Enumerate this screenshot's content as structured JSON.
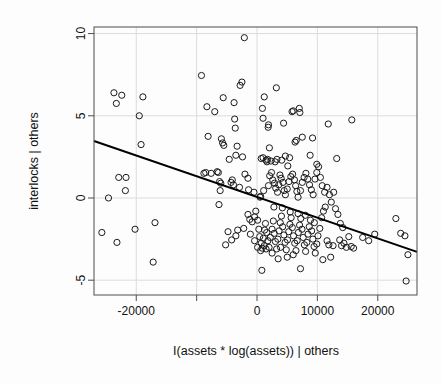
{
  "chart_data": {
    "type": "scatter",
    "title": "",
    "subtitle": "",
    "xlabel": "I(assets * log(assets)) | others",
    "ylabel": "interlocks | others",
    "xlim": [
      -27000,
      26500
    ],
    "ylim": [
      -5.9,
      10.4
    ],
    "grid": true,
    "legend": false,
    "legend_position": "none",
    "xticks": [
      -20000,
      -10000,
      0,
      10000,
      20000
    ],
    "xtick_labels": [
      "-20000",
      "",
      "0",
      "10000",
      "20000"
    ],
    "yticks": [
      -5,
      0,
      5,
      10
    ],
    "ytick_labels": [
      "-5",
      "0",
      "5",
      "10"
    ],
    "point_style": {
      "marker": "open-circle",
      "radius": 3.1,
      "stroke": "#1a1a1a",
      "stroke_width": 1.0,
      "fill": "none"
    },
    "fit_line": {
      "label": "least-squares partial fit",
      "color": "#000000",
      "width": 2.0,
      "x_start": -27000,
      "y_start": 3.47,
      "x_end": 26500,
      "y_end": -3.28,
      "slope": -0.000126,
      "intercept": 0.067
    },
    "frame": {
      "color": "#4d4d4d",
      "width": 1.0
    },
    "grid_color": "#dcdcdc",
    "points": [
      [
        -2100,
        9.75
      ],
      [
        -9200,
        7.45
      ],
      [
        -23700,
        6.4
      ],
      [
        -22400,
        6.25
      ],
      [
        -18900,
        6.15
      ],
      [
        -5600,
        6.1
      ],
      [
        -23300,
        5.75
      ],
      [
        -3800,
        5.8
      ],
      [
        -2800,
        6.85
      ],
      [
        -2500,
        7.05
      ],
      [
        3200,
        6.7
      ],
      [
        1200,
        6.15
      ],
      [
        -8300,
        5.55
      ],
      [
        -7000,
        5.25
      ],
      [
        900,
        5.45
      ],
      [
        -19500,
        5.0
      ],
      [
        1000,
        4.85
      ],
      [
        6000,
        5.3
      ],
      [
        7000,
        5.45
      ],
      [
        7100,
        5.2
      ],
      [
        5800,
        5.25
      ],
      [
        11800,
        4.5
      ],
      [
        15700,
        4.75
      ],
      [
        -3600,
        4.25
      ],
      [
        -3700,
        4.8
      ],
      [
        4400,
        4.55
      ],
      [
        1900,
        4.45
      ],
      [
        1850,
        4.3
      ],
      [
        -8100,
        3.75
      ],
      [
        -5900,
        3.6
      ],
      [
        -5700,
        3.35
      ],
      [
        -5500,
        3.2
      ],
      [
        -19200,
        3.25
      ],
      [
        7500,
        3.7
      ],
      [
        6500,
        3.5
      ],
      [
        6300,
        3.4
      ],
      [
        9200,
        3.65
      ],
      [
        -3500,
        2.6
      ],
      [
        -2400,
        2.5
      ],
      [
        1750,
        2.35
      ],
      [
        1500,
        2.3
      ],
      [
        1650,
        2.2
      ],
      [
        2300,
        2.25
      ],
      [
        4100,
        2.3
      ],
      [
        3000,
        2.2
      ],
      [
        13200,
        2.4
      ],
      [
        5100,
        1.95
      ],
      [
        -22900,
        1.25
      ],
      [
        -21700,
        1.25
      ],
      [
        -21800,
        0.45
      ],
      [
        -24600,
        0.0
      ],
      [
        -8500,
        1.55
      ],
      [
        -6600,
        1.6
      ],
      [
        -6400,
        1.55
      ],
      [
        -7600,
        1.5
      ],
      [
        -6200,
        1.0
      ],
      [
        -6000,
        0.9
      ],
      [
        -6100,
        0.45
      ],
      [
        -6300,
        -0.4
      ],
      [
        -4300,
        0.95
      ],
      [
        -3900,
        0.8
      ],
      [
        -2900,
        0.65
      ],
      [
        -1400,
        0.5
      ],
      [
        -500,
        0.35
      ],
      [
        500,
        0.05
      ],
      [
        600,
        0.1
      ],
      [
        1100,
        0.45
      ],
      [
        1900,
        0.75
      ],
      [
        2100,
        1.35
      ],
      [
        2400,
        1.55
      ],
      [
        2600,
        1.1
      ],
      [
        2900,
        0.9
      ],
      [
        3100,
        0.6
      ],
      [
        3400,
        0.35
      ],
      [
        3600,
        0.8
      ],
      [
        3800,
        1.4
      ],
      [
        4000,
        1.2
      ],
      [
        4300,
        0.95
      ],
      [
        4500,
        0.45
      ],
      [
        4700,
        0.2
      ],
      [
        5000,
        0.55
      ],
      [
        5300,
        1.0
      ],
      [
        5600,
        1.3
      ],
      [
        5900,
        1.45
      ],
      [
        6200,
        1.1
      ],
      [
        6400,
        0.75
      ],
      [
        6600,
        0.4
      ],
      [
        6800,
        0.05
      ],
      [
        7200,
        0.45
      ],
      [
        7500,
        0.95
      ],
      [
        7800,
        1.25
      ],
      [
        8100,
        1.5
      ],
      [
        8400,
        1.15
      ],
      [
        8700,
        0.8
      ],
      [
        9000,
        0.5
      ],
      [
        9300,
        0.2
      ],
      [
        9600,
        1.15
      ],
      [
        9900,
        1.55
      ],
      [
        10200,
        1.9
      ],
      [
        10500,
        1.25
      ],
      [
        10800,
        0.75
      ],
      [
        11200,
        0.35
      ],
      [
        11600,
        0.65
      ],
      [
        12000,
        0.2
      ],
      [
        12300,
        -0.25
      ],
      [
        12700,
        0.35
      ],
      [
        -2200,
        -1.85
      ],
      [
        -3200,
        -1.95
      ],
      [
        -3500,
        -2.3
      ],
      [
        -4200,
        -2.55
      ],
      [
        -16900,
        -1.5
      ],
      [
        -17200,
        -3.9
      ],
      [
        -20200,
        -1.9
      ],
      [
        -25700,
        -2.1
      ],
      [
        -23200,
        -2.7
      ],
      [
        -1200,
        -1.3
      ],
      [
        -1500,
        -1.0
      ],
      [
        -800,
        -1.45
      ],
      [
        -400,
        -1.15
      ],
      [
        -200,
        -0.8
      ],
      [
        100,
        -1.35
      ],
      [
        300,
        -1.9
      ],
      [
        450,
        -2.35
      ],
      [
        700,
        -2.75
      ],
      [
        850,
        -3.05
      ],
      [
        1050,
        -2.45
      ],
      [
        1250,
        -1.95
      ],
      [
        1400,
        -1.55
      ],
      [
        1600,
        -2.1
      ],
      [
        1800,
        -2.6
      ],
      [
        2000,
        -3.0
      ],
      [
        2200,
        -2.4
      ],
      [
        2500,
        -1.9
      ],
      [
        2700,
        -1.4
      ],
      [
        2850,
        -2.15
      ],
      [
        3050,
        -2.65
      ],
      [
        3250,
        -3.1
      ],
      [
        3450,
        -2.5
      ],
      [
        3650,
        -2.0
      ],
      [
        3850,
        -1.5
      ],
      [
        4050,
        -1.1
      ],
      [
        4250,
        -1.75
      ],
      [
        4450,
        -2.25
      ],
      [
        4650,
        -2.7
      ],
      [
        4850,
        -3.15
      ],
      [
        5050,
        -2.55
      ],
      [
        5250,
        -2.05
      ],
      [
        5450,
        -1.6
      ],
      [
        5650,
        -1.2
      ],
      [
        5850,
        -1.8
      ],
      [
        6050,
        -2.3
      ],
      [
        6250,
        -2.75
      ],
      [
        6450,
        -3.2
      ],
      [
        6650,
        -2.6
      ],
      [
        6850,
        -2.1
      ],
      [
        7050,
        -1.65
      ],
      [
        7250,
        -1.25
      ],
      [
        7450,
        -1.9
      ],
      [
        7650,
        -2.4
      ],
      [
        7850,
        -2.85
      ],
      [
        8050,
        -3.25
      ],
      [
        8250,
        -2.7
      ],
      [
        8450,
        -2.2
      ],
      [
        8650,
        -1.75
      ],
      [
        8850,
        -1.35
      ],
      [
        9050,
        -2.0
      ],
      [
        9250,
        -2.5
      ],
      [
        9450,
        -2.95
      ],
      [
        9650,
        -3.35
      ],
      [
        9900,
        -2.8
      ],
      [
        10100,
        -2.3
      ],
      [
        10400,
        -1.85
      ],
      [
        10700,
        -1.2
      ],
      [
        11000,
        -0.8
      ],
      [
        11300,
        -0.55
      ],
      [
        11600,
        -2.6
      ],
      [
        11900,
        -2.85
      ],
      [
        12200,
        -3.6
      ],
      [
        12600,
        -2.9
      ],
      [
        13000,
        -0.65
      ],
      [
        13400,
        -1.0
      ],
      [
        13700,
        -2.55
      ],
      [
        14000,
        -2.9
      ],
      [
        14400,
        -2.75
      ],
      [
        14800,
        -3.0
      ],
      [
        15200,
        -2.35
      ],
      [
        15600,
        -2.95
      ],
      [
        16000,
        -3.05
      ],
      [
        17500,
        -2.4
      ],
      [
        18500,
        -2.6
      ],
      [
        19500,
        -2.2
      ],
      [
        23000,
        -1.25
      ],
      [
        23800,
        -2.15
      ],
      [
        24500,
        -2.3
      ],
      [
        25000,
        -3.45
      ],
      [
        24700,
        -5.05
      ],
      [
        7200,
        -4.3
      ],
      [
        800,
        -4.4
      ],
      [
        -5200,
        -2.85
      ],
      [
        -4800,
        -2.05
      ],
      [
        3500,
        -3.7
      ],
      [
        2500,
        -3.35
      ],
      [
        1500,
        -3.1
      ],
      [
        5000,
        -3.6
      ],
      [
        6000,
        -3.45
      ],
      [
        8000,
        -1.05
      ],
      [
        4200,
        -0.6
      ],
      [
        2800,
        -0.55
      ],
      [
        10900,
        -3.75
      ],
      [
        1200,
        -2.9
      ],
      [
        600,
        -3.2
      ],
      [
        -400,
        -2.6
      ],
      [
        -1100,
        -2.2
      ],
      [
        100,
        -3.0
      ],
      [
        3900,
        -3.0
      ],
      [
        9500,
        -1.5
      ],
      [
        13800,
        -1.55
      ],
      [
        14200,
        -1.8
      ],
      [
        5500,
        -0.85
      ],
      [
        6800,
        -0.95
      ],
      [
        2050,
        3.05
      ],
      [
        -4600,
        2.35
      ],
      [
        -3300,
        3.15
      ],
      [
        700,
        2.4
      ],
      [
        1000,
        2.45
      ],
      [
        -1500,
        1.2
      ],
      [
        -2000,
        1.45
      ],
      [
        -4100,
        1.1
      ],
      [
        -8800,
        1.5
      ],
      [
        5400,
        2.45
      ],
      [
        3300,
        2.35
      ],
      [
        4700,
        2.55
      ],
      [
        8800,
        2.6
      ],
      [
        9900,
        2.05
      ]
    ]
  }
}
